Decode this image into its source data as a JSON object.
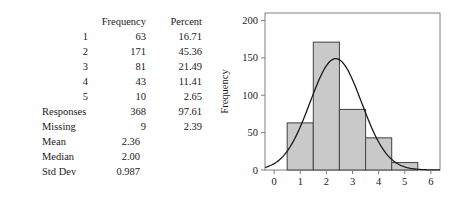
{
  "table": {
    "headers": {
      "label_col": "",
      "frequency": "Frequency",
      "percent": "Percent"
    },
    "value_rows": [
      {
        "label": "1",
        "frequency": "63",
        "percent": "16.71"
      },
      {
        "label": "2",
        "frequency": "171",
        "percent": "45.36"
      },
      {
        "label": "3",
        "frequency": "81",
        "percent": "21.49"
      },
      {
        "label": "4",
        "frequency": "43",
        "percent": "11.41"
      },
      {
        "label": "5",
        "frequency": "10",
        "percent": "2.65"
      }
    ],
    "summary_rows": [
      {
        "label": "Responses",
        "frequency": "368",
        "percent": "97.61",
        "decimal": false
      },
      {
        "label": "Missing",
        "frequency": "9",
        "percent": "2.39",
        "decimal": false
      },
      {
        "label": "Mean",
        "frequency": "2.36",
        "percent": "",
        "decimal": true
      },
      {
        "label": "Median",
        "frequency": "2.00",
        "percent": "",
        "decimal": true
      },
      {
        "label": "Std Dev",
        "frequency": "0.987",
        "percent": "",
        "decimal": true
      }
    ]
  },
  "chart_data": {
    "type": "bar",
    "title": "",
    "xlabel": "",
    "ylabel": "Frequency",
    "categories": [
      1,
      2,
      3,
      4,
      5
    ],
    "values": [
      63,
      171,
      81,
      43,
      10
    ],
    "bar_width": 1,
    "xlim": [
      -0.35,
      6.35
    ],
    "ylim": [
      0,
      210
    ],
    "xticks": [
      0,
      1,
      2,
      3,
      4,
      5,
      6
    ],
    "xtick_labels": [
      "0",
      "1",
      "2",
      "3",
      "4",
      "5",
      "6"
    ],
    "yticks": [
      0,
      50,
      100,
      150,
      200
    ],
    "ytick_labels": [
      "0",
      "50",
      "100",
      "150",
      "200"
    ],
    "grid": false,
    "legend": false,
    "bar_fill_color": "#c9c9c9",
    "bar_edge_color": "#4d4d4d",
    "curve_color": "#1a1a1a",
    "frame_color": "#808080",
    "overlay_curve": {
      "name": "normal",
      "mean": 2.36,
      "std_dev": 0.987,
      "peak_value": 149
    }
  }
}
